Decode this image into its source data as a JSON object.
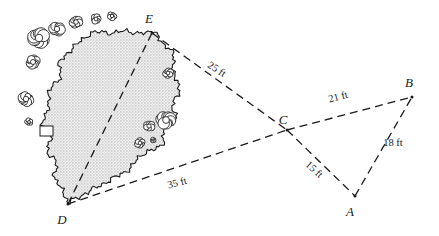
{
  "figure": {
    "name": "pond-survey-triangles-diagram",
    "colors": {
      "ink": "#1a1a1a",
      "pond_fill": "#e6e6e6",
      "stipple": "#9a9a9a",
      "background": "#ffffff"
    }
  },
  "vertices": [
    {
      "id": "E",
      "label": "E",
      "x": 152,
      "y": 33,
      "label_x": 149,
      "label_y": 23
    },
    {
      "id": "D",
      "label": "D",
      "x": 68,
      "y": 204,
      "label_x": 62,
      "label_y": 224
    },
    {
      "id": "C",
      "label": "C",
      "x": 287,
      "y": 130,
      "label_x": 283,
      "label_y": 124
    },
    {
      "id": "B",
      "label": "B",
      "x": 412,
      "y": 97,
      "label_x": 409,
      "label_y": 87
    },
    {
      "id": "A",
      "label": "A",
      "x": 355,
      "y": 196,
      "label_x": 350,
      "label_y": 216
    }
  ],
  "segments": [
    {
      "id": "EC",
      "from": "E",
      "to": "C",
      "style": "dashed"
    },
    {
      "id": "DC",
      "from": "D",
      "to": "C",
      "style": "dashed"
    },
    {
      "id": "DE",
      "from": "D",
      "to": "E",
      "style": "dashed"
    },
    {
      "id": "CB",
      "from": "C",
      "to": "B",
      "style": "dashed"
    },
    {
      "id": "CA",
      "from": "C",
      "to": "A",
      "style": "dashed"
    },
    {
      "id": "AB",
      "from": "A",
      "to": "B",
      "style": "dashed"
    }
  ],
  "measurements": [
    {
      "id": "EC",
      "text": "25 ft",
      "x": 215,
      "y": 72,
      "rotation": 33
    },
    {
      "id": "DC",
      "text": "35 ft",
      "x": 178,
      "y": 186,
      "rotation": -15
    },
    {
      "id": "CB",
      "text": "21 ft",
      "x": 339,
      "y": 100,
      "rotation": -15
    },
    {
      "id": "CA",
      "text": "15 ft",
      "x": 312,
      "y": 172,
      "rotation": 42
    },
    {
      "id": "AB",
      "text": "18 ft",
      "x": 393,
      "y": 146,
      "rotation": 0
    }
  ],
  "pond": {
    "name": "stippled-pond-island",
    "outline": "M 152 33 C 140 34, 128 30, 118 32 C 107 34, 99 30, 90 34 C 82 38, 78 44, 72 49 C 66 54, 62 57, 60 63 C 58 69, 62 73, 59 79 C 56 85, 50 87, 48 93 C 46 99, 51 103, 49 109 C 47 115, 41 117, 42 123 C 43 129, 49 129, 50 135 C 51 141, 46 145, 48 151 C 50 157, 55 158, 56 164 C 57 170, 53 175, 56 181 C 59 187, 64 191, 66 197 C 67 201, 68 203, 68 204 C 74 199, 80 196, 88 192 C 96 188, 102 184, 110 180 C 118 176, 124 173, 130 168 C 136 163, 138 157, 144 153 C 150 149, 157 151, 161 146 C 165 141, 161 135, 164 130 C 167 125, 173 125, 175 119 C 177 113, 172 108, 173 102 C 174 96, 180 94, 180 88 C 180 82, 174 79, 173 73 C 172 67, 176 62, 174 56 C 172 50, 166 48, 163 43 C 160 38, 158 34, 152 33 Z"
  },
  "bushes": [
    {
      "cx": 39,
      "cy": 38,
      "r": 9,
      "name": "shrub-cluster-upper-left-large"
    },
    {
      "cx": 57,
      "cy": 29,
      "r": 6.5,
      "name": "shrub-cluster-upper-left-mid"
    },
    {
      "cx": 76,
      "cy": 22,
      "r": 5.5,
      "name": "shrub-cluster-top-left"
    },
    {
      "cx": 96,
      "cy": 19,
      "r": 4.5,
      "name": "shrub-cluster-top-center"
    },
    {
      "cx": 112,
      "cy": 16,
      "r": 4,
      "name": "shrub-cluster-top-right"
    },
    {
      "cx": 33,
      "cy": 62,
      "r": 6,
      "name": "shrub-cluster-left-upper"
    },
    {
      "cx": 26,
      "cy": 99,
      "r": 6.5,
      "name": "shrub-cluster-left-lower"
    },
    {
      "cx": 29,
      "cy": 122,
      "r": 3.5,
      "name": "shrub-small-left"
    },
    {
      "cx": 168,
      "cy": 73,
      "r": 4.5,
      "name": "shrub-cluster-right-upper"
    },
    {
      "cx": 166,
      "cy": 120,
      "r": 8,
      "name": "shrub-cluster-right-large"
    },
    {
      "cx": 149,
      "cy": 126,
      "r": 5,
      "name": "shrub-cluster-right-mid"
    },
    {
      "cx": 140,
      "cy": 143,
      "r": 4.5,
      "name": "shrub-cluster-right-lower"
    },
    {
      "cx": 153,
      "cy": 140,
      "r": 2.5,
      "name": "shrub-small-right"
    }
  ],
  "dock": {
    "x": 40,
    "y": 126,
    "width": 13,
    "height": 10,
    "name": "dock-rectangle"
  }
}
